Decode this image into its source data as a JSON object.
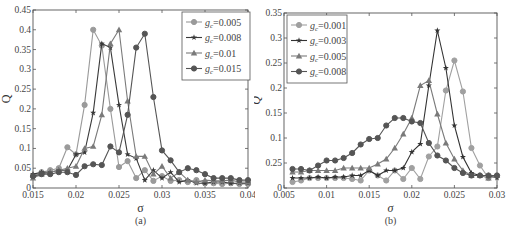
{
  "chart_data": [
    {
      "id": "a",
      "type": "line",
      "caption": "(a)",
      "xlabel": "σ",
      "ylabel": "Q",
      "xlim": [
        0.015,
        0.04
      ],
      "ylim": [
        0,
        0.45
      ],
      "xticks": [
        0.015,
        0.02,
        0.025,
        0.03,
        0.035,
        0.04
      ],
      "xtick_labels": [
        "0.015",
        "0.02",
        "0.025",
        "0.03",
        "0.035",
        "0.04"
      ],
      "yticks": [
        0,
        0.05,
        0.1,
        0.15,
        0.2,
        0.25,
        0.3,
        0.35,
        0.4,
        0.45
      ],
      "ytick_labels": [
        "0",
        "0.05",
        "0.1",
        "0.15",
        "0.2",
        "0.25",
        "0.3",
        "0.35",
        "0.4",
        "0.45"
      ],
      "grid": false,
      "legend_position": "upper right",
      "x": [
        0.015,
        0.016,
        0.017,
        0.018,
        0.019,
        0.02,
        0.021,
        0.022,
        0.023,
        0.024,
        0.025,
        0.026,
        0.027,
        0.028,
        0.029,
        0.03,
        0.031,
        0.032,
        0.033,
        0.034,
        0.035,
        0.036,
        0.037,
        0.038,
        0.039,
        0.04
      ],
      "series": [
        {
          "name": "g_c=0.005",
          "label_main": "g",
          "label_sub": "c",
          "label_val": "=0.005",
          "color": "#9a9a9a",
          "marker": "circle",
          "values": [
            0.03,
            0.04,
            0.045,
            0.05,
            0.103,
            0.085,
            0.21,
            0.4,
            0.36,
            0.2,
            0.053,
            0.068,
            0.025,
            0.045,
            0.018,
            0.03,
            0.018,
            0.02,
            0.015,
            0.02,
            0.012,
            0.012,
            0.01,
            0.012,
            0.01,
            0.01
          ]
        },
        {
          "name": "g_c=0.008",
          "label_main": "g",
          "label_sub": "c",
          "label_val": "=0.008",
          "color": "#3a3a3a",
          "marker": "star",
          "values": [
            0.035,
            0.04,
            0.04,
            0.045,
            0.045,
            0.085,
            0.09,
            0.19,
            0.365,
            0.355,
            0.21,
            0.085,
            0.075,
            0.02,
            0.045,
            0.025,
            0.04,
            0.015,
            0.02,
            0.012,
            0.012,
            0.015,
            0.015,
            0.012,
            0.012,
            0.012
          ]
        },
        {
          "name": "g_c=0.01",
          "label_main": "g",
          "label_sub": "c",
          "label_val": "=0.01",
          "color": "#7a7a7a",
          "marker": "triangle",
          "values": [
            0.025,
            0.035,
            0.04,
            0.045,
            0.05,
            0.055,
            0.1,
            0.105,
            0.185,
            0.365,
            0.4,
            0.22,
            0.08,
            0.08,
            0.035,
            0.055,
            0.025,
            0.04,
            0.02,
            0.015,
            0.02,
            0.018,
            0.018,
            0.02,
            0.015,
            0.015
          ]
        },
        {
          "name": "g_c=0.015",
          "label_main": "g",
          "label_sub": "c",
          "label_val": "=0.015",
          "color": "#555555",
          "marker": "circle",
          "values": [
            0.03,
            0.035,
            0.035,
            0.04,
            0.04,
            0.033,
            0.055,
            0.06,
            0.058,
            0.105,
            0.09,
            0.185,
            0.355,
            0.39,
            0.23,
            0.095,
            0.07,
            0.04,
            0.05,
            0.045,
            0.035,
            0.025,
            0.025,
            0.025,
            0.02,
            0.02
          ]
        }
      ]
    },
    {
      "id": "b",
      "type": "line",
      "caption": "(b)",
      "xlabel": "σ",
      "ylabel": "Q",
      "xlim": [
        0.005,
        0.03
      ],
      "ylim": [
        0,
        0.35
      ],
      "xticks": [
        0.005,
        0.01,
        0.015,
        0.02,
        0.025,
        0.03
      ],
      "xtick_labels": [
        "0.005",
        "0.01",
        "0.015",
        "0.02",
        "0.025",
        "0.03"
      ],
      "yticks": [
        0,
        0.05,
        0.1,
        0.15,
        0.2,
        0.25,
        0.3,
        0.35
      ],
      "ytick_labels": [
        "0",
        "0.25",
        "0.1",
        "0.15",
        "0.2",
        "0.25",
        "0.3",
        "0.35"
      ],
      "grid": false,
      "legend_position": "upper left",
      "x": [
        0.006,
        0.007,
        0.008,
        0.009,
        0.01,
        0.011,
        0.012,
        0.013,
        0.014,
        0.015,
        0.016,
        0.017,
        0.018,
        0.019,
        0.02,
        0.021,
        0.022,
        0.023,
        0.024,
        0.025,
        0.026,
        0.027,
        0.028,
        0.029,
        0.03
      ],
      "series": [
        {
          "name": "g_c=0.001",
          "label_main": "g",
          "label_sub": "c",
          "label_val": "=0.001",
          "color": "#a0a0a0",
          "marker": "circle",
          "values": [
            0.012,
            0.015,
            0.02,
            0.02,
            0.02,
            0.02,
            0.02,
            0.018,
            0.015,
            0.035,
            0.025,
            0.015,
            0.035,
            0.018,
            0.04,
            0.018,
            0.063,
            0.083,
            0.195,
            0.255,
            0.193,
            0.08,
            0.045,
            0.02,
            0.025
          ]
        },
        {
          "name": "g_c=0.003",
          "label_main": "g",
          "label_sub": "c",
          "label_val": "=0.003",
          "color": "#333333",
          "marker": "star",
          "values": [
            0.02,
            0.02,
            0.02,
            0.022,
            0.02,
            0.022,
            0.022,
            0.025,
            0.025,
            0.035,
            0.025,
            0.035,
            0.035,
            0.04,
            0.072,
            0.088,
            0.205,
            0.315,
            0.24,
            0.125,
            0.062,
            0.03,
            0.025,
            0.025,
            0.02
          ]
        },
        {
          "name": "g_c=0.005",
          "label_main": "g",
          "label_sub": "c",
          "label_val": "=0.005",
          "color": "#7a7a7a",
          "marker": "triangle",
          "values": [
            0.032,
            0.032,
            0.035,
            0.035,
            0.035,
            0.035,
            0.04,
            0.04,
            0.04,
            0.04,
            0.048,
            0.058,
            0.08,
            0.108,
            0.14,
            0.205,
            0.215,
            0.148,
            0.09,
            0.058,
            0.035,
            0.025,
            0.025,
            0.02,
            0.025
          ]
        },
        {
          "name": "g_c=0.008",
          "label_main": "g",
          "label_sub": "c",
          "label_val": "=0.008",
          "color": "#555555",
          "marker": "circle",
          "values": [
            0.038,
            0.038,
            0.035,
            0.045,
            0.055,
            0.055,
            0.06,
            0.07,
            0.087,
            0.098,
            0.1,
            0.125,
            0.14,
            0.14,
            0.133,
            0.13,
            0.09,
            0.065,
            0.055,
            0.04,
            0.03,
            0.025,
            0.025,
            0.025,
            0.025
          ]
        }
      ]
    }
  ]
}
